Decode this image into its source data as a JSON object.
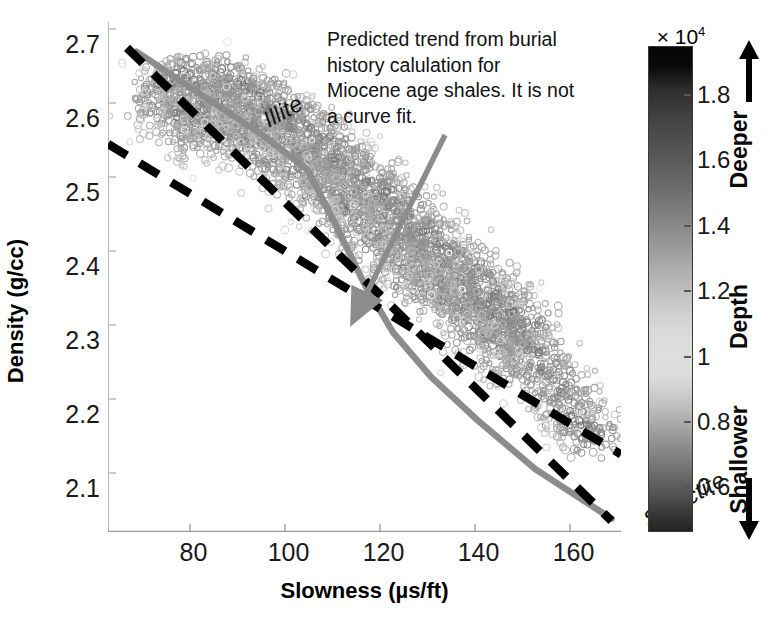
{
  "chart_data": {
    "type": "scatter",
    "title": "",
    "xlabel": "Slowness (µs/ft)",
    "ylabel": "Density (g/cc)",
    "xlim": [
      62,
      170
    ],
    "ylim": [
      2.04,
      2.73
    ],
    "xticks": [
      80,
      100,
      120,
      140,
      160
    ],
    "xtick_labels": [
      "80",
      "100",
      "120",
      "140",
      "160"
    ],
    "yticks": [
      2.1,
      2.2,
      2.3,
      2.4,
      2.5,
      2.6,
      2.7
    ],
    "ytick_labels": [
      "2.1",
      "2.2",
      "2.3",
      "2.4",
      "2.5",
      "2.6",
      "2.7"
    ],
    "grid": false,
    "legend_position": "none",
    "colormap": "gray-inverted-depth",
    "scatter_description": "Dense cloud of small open-circle markers shaded by depth, trending from upper-left (low slowness, high density) to lower-right (high slowness, low density).",
    "series": [
      {
        "name": "Illite reference line",
        "type": "line",
        "style": "dashed",
        "color": "#000000",
        "label": "Illite",
        "points": [
          [
            66,
            2.695
          ],
          [
            168,
            2.055
          ]
        ]
      },
      {
        "name": "Smectite reference line",
        "type": "line",
        "style": "dashed",
        "color": "#000000",
        "label": "Smectite",
        "points": [
          [
            62,
            2.565
          ],
          [
            170,
            2.145
          ]
        ]
      },
      {
        "name": "Predicted burial-history trend",
        "type": "line",
        "style": "solid",
        "color": "#8c8c8c",
        "points": [
          [
            68,
            2.69
          ],
          [
            82,
            2.63
          ],
          [
            95,
            2.575
          ],
          [
            104,
            2.53
          ],
          [
            110,
            2.455
          ],
          [
            116,
            2.375
          ],
          [
            122,
            2.31
          ],
          [
            130,
            2.25
          ],
          [
            140,
            2.19
          ],
          [
            152,
            2.125
          ],
          [
            168,
            2.058
          ]
        ]
      }
    ],
    "scatter_points": [
      [
        72,
        2.641
      ],
      [
        74,
        2.627
      ],
      [
        76,
        2.652
      ],
      [
        77,
        2.6
      ],
      [
        78,
        2.663
      ],
      [
        79,
        2.618
      ],
      [
        80,
        2.59
      ],
      [
        81,
        2.648
      ],
      [
        82,
        2.612
      ],
      [
        83,
        2.575
      ],
      [
        84,
        2.634
      ],
      [
        85,
        2.601
      ],
      [
        86,
        2.658
      ],
      [
        87,
        2.585
      ],
      [
        88,
        2.622
      ],
      [
        89,
        2.596
      ],
      [
        90,
        2.645
      ],
      [
        91,
        2.571
      ],
      [
        92,
        2.608
      ],
      [
        93,
        2.63
      ],
      [
        94,
        2.566
      ],
      [
        95,
        2.594
      ],
      [
        96,
        2.617
      ],
      [
        97,
        2.549
      ],
      [
        98,
        2.581
      ],
      [
        99,
        2.605
      ],
      [
        100,
        2.539
      ],
      [
        101,
        2.572
      ],
      [
        102,
        2.596
      ],
      [
        103,
        2.522
      ],
      [
        104,
        2.556
      ],
      [
        105,
        2.584
      ],
      [
        106,
        2.508
      ],
      [
        107,
        2.54
      ],
      [
        108,
        2.566
      ],
      [
        109,
        2.492
      ],
      [
        110,
        2.524
      ],
      [
        111,
        2.55
      ],
      [
        112,
        2.476
      ],
      [
        113,
        2.505
      ],
      [
        114,
        2.534
      ],
      [
        115,
        2.458
      ],
      [
        116,
        2.488
      ],
      [
        117,
        2.516
      ],
      [
        118,
        2.44
      ],
      [
        119,
        2.47
      ],
      [
        120,
        2.498
      ],
      [
        121,
        2.424
      ],
      [
        122,
        2.452
      ],
      [
        123,
        2.48
      ],
      [
        124,
        2.406
      ],
      [
        125,
        2.436
      ],
      [
        126,
        2.462
      ],
      [
        127,
        2.39
      ],
      [
        128,
        2.418
      ],
      [
        129,
        2.446
      ],
      [
        130,
        2.372
      ],
      [
        131,
        2.4
      ],
      [
        132,
        2.428
      ],
      [
        133,
        2.356
      ],
      [
        134,
        2.384
      ],
      [
        135,
        2.41
      ],
      [
        136,
        2.338
      ],
      [
        137,
        2.366
      ],
      [
        138,
        2.392
      ],
      [
        139,
        2.322
      ],
      [
        140,
        2.348
      ],
      [
        141,
        2.374
      ],
      [
        142,
        2.304
      ],
      [
        143,
        2.33
      ],
      [
        144,
        2.356
      ],
      [
        145,
        2.288
      ],
      [
        146,
        2.312
      ],
      [
        147,
        2.338
      ],
      [
        148,
        2.27
      ],
      [
        149,
        2.296
      ],
      [
        150,
        2.32
      ],
      [
        152,
        2.278
      ],
      [
        154,
        2.258
      ],
      [
        156,
        2.24
      ],
      [
        158,
        2.222
      ],
      [
        160,
        2.204
      ],
      [
        162,
        2.186
      ],
      [
        164,
        2.168
      ]
    ]
  },
  "axes": {
    "y_title": "Density (g/cc)",
    "x_title": "Slowness (µs/ft)",
    "y_tick_labels": [
      "2.7",
      "2.6",
      "2.5",
      "2.4",
      "2.3",
      "2.2",
      "2.1"
    ],
    "x_tick_labels": [
      "80",
      "100",
      "120",
      "140",
      "160"
    ]
  },
  "annotation": {
    "text": "Predicted trend from burial history calulation for Miocene age shales. It is not a curve fit.",
    "arrow_color": "#8c8c8c"
  },
  "phase_labels": {
    "illite": "Illite",
    "smectite": "Smectite"
  },
  "colorbar": {
    "exponent_prefix": "× 10",
    "exponent_power": "4",
    "tick_labels": [
      "1.8",
      "1.6",
      "1.4",
      "1.2",
      "1",
      "0.8",
      "0.6"
    ],
    "tick_values": [
      1.8,
      1.6,
      1.4,
      1.2,
      1.0,
      0.8,
      0.6
    ],
    "deeper_label": "Deeper",
    "depth_label": "Depth",
    "shallower_label": "Shallower",
    "up_arrow_icon": "arrow-up-icon",
    "down_arrow_icon": "arrow-down-icon"
  },
  "colors": {
    "trend_line": "#8c8c8c",
    "reference_line": "#000000",
    "text": "#111111",
    "background": "#ffffff"
  }
}
